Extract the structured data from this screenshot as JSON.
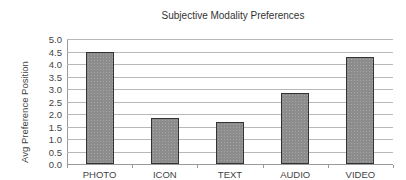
{
  "chart_data": {
    "type": "bar",
    "title": "Subjective Modality Preferences",
    "xlabel": "",
    "ylabel": "Avg Preference Position",
    "categories": [
      "PHOTO",
      "ICON",
      "TEXT",
      "AUDIO",
      "VIDEO"
    ],
    "values": [
      4.5,
      1.83,
      1.67,
      2.83,
      4.3
    ],
    "ylim": [
      0,
      5.0
    ],
    "yticks": [
      "0.0",
      "0.5",
      "1.0",
      "1.5",
      "2.0",
      "2.5",
      "3.0",
      "3.5",
      "4.0",
      "4.5",
      "5.0"
    ],
    "grid": true,
    "legend": null,
    "colors": {
      "bar_fill": "#8c8c8c",
      "bar_border": "#333333",
      "gridline": "#b8b8b8"
    }
  }
}
